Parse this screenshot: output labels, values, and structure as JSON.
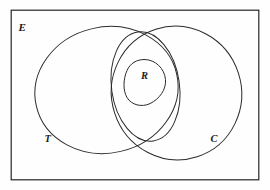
{
  "figure": {
    "kind": "venn-diagram",
    "background_color": "#fefefe",
    "line_color": "#2b2b2b",
    "frame_color": "#262626"
  },
  "labels": {
    "universe": "E",
    "set_left": "T",
    "set_right": "C",
    "set_inner": "R"
  },
  "regions": [
    {
      "name": "universe-rectangle",
      "label": "E",
      "shape": "rectangle"
    },
    {
      "name": "set-t-ellipse",
      "label": "T",
      "shape": "ellipse"
    },
    {
      "name": "set-c-ellipse",
      "label": "C",
      "shape": "ellipse"
    },
    {
      "name": "intersection-lens-ellipse",
      "label": "",
      "shape": "ellipse"
    },
    {
      "name": "set-r-blob",
      "label": "R",
      "shape": "closed-curve"
    }
  ]
}
